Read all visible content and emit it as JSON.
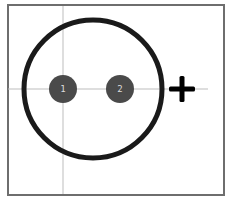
{
  "diagram": {
    "type": "footprint",
    "frame": {
      "x": 8,
      "y": 5,
      "width": 216,
      "height": 190,
      "color": "#6e6e6e"
    },
    "crosshair": {
      "x": 63,
      "y": 89,
      "color": "#bdbdbd"
    },
    "outline": {
      "cx": 93,
      "cy": 89,
      "r": 69,
      "stroke": "#1a1a1a",
      "stroke_width": 5
    },
    "pads": [
      {
        "label": "1",
        "cx": 63,
        "cy": 89,
        "r": 14,
        "fill": "#4a4a4a",
        "text_color": "#dcdcdc"
      },
      {
        "label": "2",
        "cx": 120,
        "cy": 89,
        "r": 14,
        "fill": "#4a4a4a",
        "text_color": "#dcdcdc"
      }
    ],
    "polarity_mark": {
      "symbol": "+",
      "cx": 182,
      "cy": 89,
      "color": "#000000"
    }
  }
}
